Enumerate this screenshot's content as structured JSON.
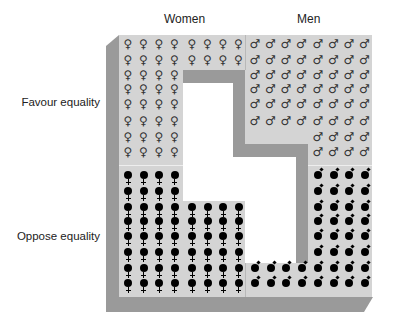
{
  "columns": {
    "women": "Women",
    "men": "Men"
  },
  "rows": {
    "favour": "Favour equality",
    "oppose": "Oppose equality"
  },
  "symbols": {
    "women_favour": "♀",
    "men_favour": "♂"
  },
  "grid": {
    "col_x": [
      128,
      143.5,
      159,
      174.5,
      192,
      207.5,
      223,
      238.5,
      255,
      270.5,
      286,
      301.5,
      318,
      333.5,
      349,
      364.5
    ],
    "row_y": [
      44,
      59.5,
      75,
      89,
      104,
      121,
      137,
      152,
      177,
      193,
      209,
      223,
      238,
      254,
      270,
      285
    ]
  },
  "counts": {
    "women_favour": 40,
    "women_oppose": 56,
    "men_favour": 56,
    "men_oppose": 40
  },
  "layout_rows": {
    "women_favour": [
      8,
      8,
      4,
      4,
      4,
      4,
      4,
      4
    ],
    "women_oppose": [
      4,
      4,
      8,
      8,
      8,
      8,
      8,
      8
    ],
    "men_favour": [
      8,
      8,
      8,
      8,
      8,
      8,
      4,
      4
    ],
    "men_oppose": [
      4,
      4,
      4,
      4,
      4,
      4,
      8,
      8
    ]
  },
  "colors": {
    "panel": "#d4d4d4",
    "shadow": "#9a9a9a",
    "symbol_favour": "#333333",
    "symbol_oppose": "#000000"
  }
}
